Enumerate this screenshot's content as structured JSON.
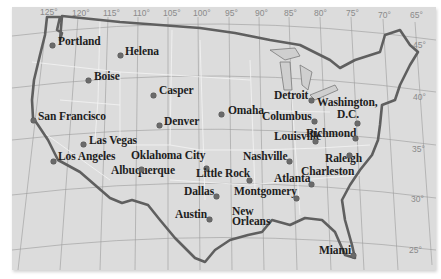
{
  "map": {
    "title": "United States major cities",
    "background_color": "#dcdcdc",
    "border_color": "#5a5a5a",
    "longitude_ticks": [
      {
        "label": "125°",
        "x": 40,
        "y": 13
      },
      {
        "label": "120°",
        "x": 72,
        "y": 14
      },
      {
        "label": "115°",
        "x": 103,
        "y": 14
      },
      {
        "label": "110°",
        "x": 133,
        "y": 14
      },
      {
        "label": "105°",
        "x": 163,
        "y": 14
      },
      {
        "label": "100°",
        "x": 193,
        "y": 14
      },
      {
        "label": "95°",
        "x": 225,
        "y": 14
      },
      {
        "label": "90°",
        "x": 255,
        "y": 14
      },
      {
        "label": "85°",
        "x": 284,
        "y": 14
      },
      {
        "label": "80°",
        "x": 314,
        "y": 14
      },
      {
        "label": "75°",
        "x": 346,
        "y": 14
      },
      {
        "label": "70°",
        "x": 378,
        "y": 16
      },
      {
        "label": "65°",
        "x": 410,
        "y": 16
      }
    ],
    "latitude_ticks": [
      {
        "label": "45°",
        "x": 413,
        "y": 46
      },
      {
        "label": "40°",
        "x": 413,
        "y": 98
      },
      {
        "label": "35°",
        "x": 412,
        "y": 150
      },
      {
        "label": "30°",
        "x": 411,
        "y": 200
      },
      {
        "label": "25°",
        "x": 409,
        "y": 251
      }
    ],
    "cities": [
      {
        "name": "Portland",
        "x": 58,
        "y": 41,
        "dot_x": 52,
        "dot_y": 45
      },
      {
        "name": "Helena",
        "x": 125,
        "y": 51,
        "dot_x": 120,
        "dot_y": 55
      },
      {
        "name": "Boise",
        "x": 94,
        "y": 76,
        "dot_x": 88,
        "dot_y": 80
      },
      {
        "name": "Casper",
        "x": 159,
        "y": 90,
        "dot_x": 153,
        "dot_y": 95
      },
      {
        "name": "San Francisco",
        "x": 38,
        "y": 116,
        "dot_x": 33,
        "dot_y": 120
      },
      {
        "name": "Denver",
        "x": 164,
        "y": 121,
        "dot_x": 159,
        "dot_y": 125
      },
      {
        "name": "Omaha",
        "x": 228,
        "y": 110,
        "dot_x": 221,
        "dot_y": 114
      },
      {
        "name": "Detroit",
        "x": 274,
        "y": 95,
        "dot_x": 311,
        "dot_y": 100
      },
      {
        "name": "Washington,",
        "x": 317,
        "y": 102,
        "dot_x": null,
        "dot_y": null
      },
      {
        "name": "D.C.",
        "x": 337,
        "y": 114,
        "dot_x": 357,
        "dot_y": 123
      },
      {
        "name": "Columbus",
        "x": 262,
        "y": 116,
        "dot_x": 314,
        "dot_y": 121
      },
      {
        "name": "Richmond",
        "x": 306,
        "y": 133,
        "dot_x": 355,
        "dot_y": 138
      },
      {
        "name": "Las Vegas",
        "x": 89,
        "y": 140,
        "dot_x": 83,
        "dot_y": 144
      },
      {
        "name": "Louisville",
        "x": 274,
        "y": 136,
        "dot_x": 315,
        "dot_y": 141
      },
      {
        "name": "Los Angeles",
        "x": 58,
        "y": 156,
        "dot_x": 53,
        "dot_y": 161
      },
      {
        "name": "Oklahoma City",
        "x": 131,
        "y": 155,
        "dot_x": 206,
        "dot_y": 168
      },
      {
        "name": "Nashville",
        "x": 243,
        "y": 156,
        "dot_x": 289,
        "dot_y": 161
      },
      {
        "name": "Raleigh",
        "x": 325,
        "y": 158,
        "dot_x": 349,
        "dot_y": 155
      },
      {
        "name": "Albuquerque",
        "x": 111,
        "y": 170,
        "dot_x": 141,
        "dot_y": 169
      },
      {
        "name": "Little Rock",
        "x": 196,
        "y": 173,
        "dot_x": 249,
        "dot_y": 180
      },
      {
        "name": "Charleston",
        "x": 301,
        "y": 171,
        "dot_x": null,
        "dot_y": null
      },
      {
        "name": "Atlanta",
        "x": 274,
        "y": 178,
        "dot_x": 311,
        "dot_y": 184
      },
      {
        "name": "Dallas",
        "x": 184,
        "y": 191,
        "dot_x": 216,
        "dot_y": 196
      },
      {
        "name": "Montgomery",
        "x": 234,
        "y": 191,
        "dot_x": 296,
        "dot_y": 198
      },
      {
        "name": "Austin",
        "x": 175,
        "y": 214,
        "dot_x": 209,
        "dot_y": 219
      },
      {
        "name": "New",
        "x": 232,
        "y": 211,
        "dot_x": null,
        "dot_y": null
      },
      {
        "name": "Orleans",
        "x": 232,
        "y": 221,
        "dot_x": null,
        "dot_y": null
      },
      {
        "name": "Miami",
        "x": 319,
        "y": 250,
        "dot_x": 353,
        "dot_y": 255
      }
    ]
  }
}
